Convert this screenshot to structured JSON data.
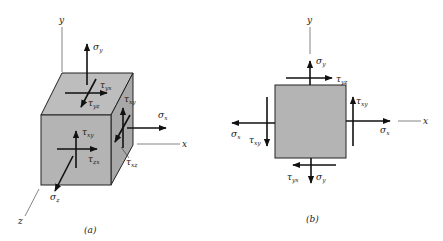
{
  "figure_a": {
    "caption": "(a)",
    "axes": {
      "x": "x",
      "y": "y",
      "z": "z"
    },
    "labels": {
      "sigma_y": {
        "sym": "σ",
        "sub": "y"
      },
      "tau_yx": {
        "sym": "τ",
        "sub": "yx"
      },
      "tau_yz": {
        "sym": "τ",
        "sub": "yz"
      },
      "tau_xy_side": {
        "sym": "τ",
        "sub": "xy"
      },
      "sigma_x": {
        "sym": "σ",
        "sub": "x"
      },
      "tau_xz": {
        "sym": "τ",
        "sub": "xz"
      },
      "tau_xy_front": {
        "sym": "τ",
        "sub": "xy"
      },
      "tau_zx": {
        "sym": "τ",
        "sub": "zx"
      },
      "sigma_z": {
        "sym": "σ",
        "sub": "z"
      }
    }
  },
  "figure_b": {
    "caption": "(b)",
    "axes": {
      "x": "x",
      "y": "y"
    },
    "labels": {
      "sigma_y_top": {
        "sym": "σ",
        "sub": "y"
      },
      "tau_yz_top": {
        "sym": "τ",
        "sub": "yz"
      },
      "tau_xy_right": {
        "sym": "τ",
        "sub": "xy"
      },
      "sigma_x_right": {
        "sym": "σ",
        "sub": "x"
      },
      "sigma_x_left": {
        "sym": "σ",
        "sub": "x"
      },
      "tau_xy_left": {
        "sym": "τ",
        "sub": "xy"
      },
      "tau_yx_bottom": {
        "sym": "τ",
        "sub": "yx"
      },
      "sigma_y_bottom": {
        "sym": "σ",
        "sub": "y"
      }
    }
  },
  "colors": {
    "face": "#b4b4b4",
    "face_top": "#bdbdbd",
    "face_side": "#a9a9a9",
    "ink": "#111111",
    "axis": "#555555"
  }
}
